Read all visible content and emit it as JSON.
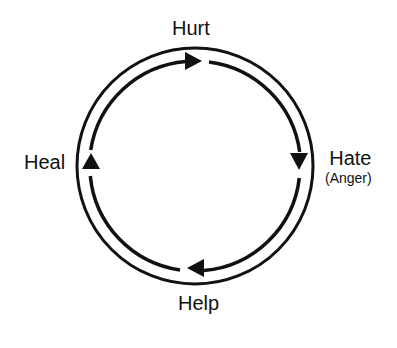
{
  "diagram": {
    "type": "cycle",
    "direction": "clockwise",
    "nodes": [
      {
        "id": "hurt",
        "label": "Hurt",
        "position": "top"
      },
      {
        "id": "hate",
        "label": "Hate",
        "sublabel": "(Anger)",
        "position": "right"
      },
      {
        "id": "help",
        "label": "Help",
        "position": "bottom"
      },
      {
        "id": "heal",
        "label": "Heal",
        "position": "left"
      }
    ],
    "edges": [
      {
        "from": "heal",
        "to": "hurt"
      },
      {
        "from": "hurt",
        "to": "hate"
      },
      {
        "from": "hate",
        "to": "help"
      },
      {
        "from": "help",
        "to": "heal"
      }
    ],
    "colors": {
      "stroke": "#111111",
      "background": "#ffffff",
      "text": "#111111"
    }
  }
}
